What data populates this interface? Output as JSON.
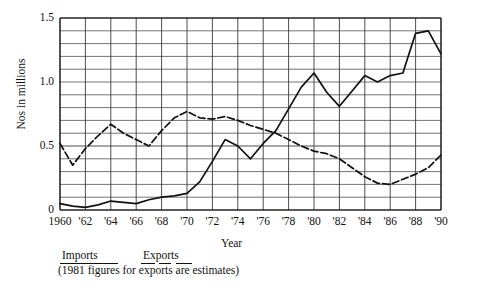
{
  "chart_data": {
    "type": "line",
    "title": "",
    "xlabel": "Year",
    "ylabel": "Nos in millions",
    "xlim": [
      1960,
      1990
    ],
    "ylim": [
      0,
      1.5
    ],
    "y_ticks": [
      "0",
      "0.5",
      "1.0",
      "1.5"
    ],
    "y_tick_values": [
      0,
      0.5,
      1.0,
      1.5
    ],
    "y_minor_step": 0.1,
    "x_ticks": [
      "1960",
      "'62",
      "'64",
      "'66",
      "'68",
      "'70",
      "'72",
      "'74",
      "'76",
      "'78",
      "'80",
      "'82",
      "'84",
      "'86",
      "'88",
      "'90"
    ],
    "x_tick_values": [
      1960,
      1962,
      1964,
      1966,
      1968,
      1970,
      1972,
      1974,
      1976,
      1978,
      1980,
      1982,
      1984,
      1986,
      1988,
      1990
    ],
    "grid": true,
    "legend_position": "below-axes",
    "note": "(1981 figures for exports are estimates)",
    "series": [
      {
        "name": "Imports",
        "style": "solid",
        "color": "#111111",
        "x": [
          1960,
          1961,
          1962,
          1963,
          1964,
          1965,
          1966,
          1967,
          1968,
          1969,
          1970,
          1971,
          1972,
          1973,
          1974,
          1975,
          1976,
          1977,
          1978,
          1979,
          1980,
          1981,
          1982,
          1983,
          1984,
          1985,
          1986,
          1987,
          1988,
          1989,
          1990
        ],
        "values": [
          0.05,
          0.03,
          0.02,
          0.04,
          0.07,
          0.06,
          0.05,
          0.08,
          0.1,
          0.11,
          0.13,
          0.22,
          0.38,
          0.55,
          0.5,
          0.4,
          0.52,
          0.62,
          0.79,
          0.96,
          1.07,
          0.92,
          0.81,
          0.93,
          1.05,
          1.0,
          1.05,
          1.07,
          1.38,
          1.4,
          1.22
        ]
      },
      {
        "name": "Exports",
        "style": "dashed",
        "color": "#111111",
        "x": [
          1960,
          1961,
          1962,
          1963,
          1964,
          1965,
          1966,
          1967,
          1968,
          1969,
          1970,
          1971,
          1972,
          1973,
          1974,
          1975,
          1976,
          1977,
          1978,
          1979,
          1980,
          1981,
          1982,
          1983,
          1984,
          1985,
          1986,
          1987,
          1988,
          1989,
          1990
        ],
        "values": [
          0.52,
          0.35,
          0.48,
          0.58,
          0.67,
          0.6,
          0.55,
          0.5,
          0.62,
          0.72,
          0.77,
          0.72,
          0.71,
          0.73,
          0.7,
          0.66,
          0.63,
          0.6,
          0.55,
          0.5,
          0.46,
          0.44,
          0.4,
          0.33,
          0.26,
          0.21,
          0.2,
          0.24,
          0.28,
          0.33,
          0.43
        ]
      }
    ]
  },
  "legend": {
    "imports_label": "Imports",
    "exports_label": "Exports"
  },
  "axes": {
    "x_title": "Year",
    "y_title": "Nos in millions"
  }
}
